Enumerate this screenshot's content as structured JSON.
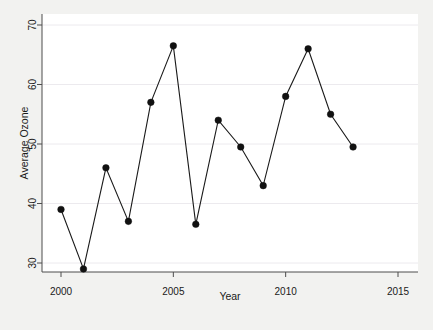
{
  "chart_data": {
    "type": "line",
    "title": "",
    "xlabel": "Year",
    "ylabel": "Average Ozone",
    "x": [
      2000,
      2001,
      2002,
      2003,
      2004,
      2005,
      2006,
      2007,
      2008,
      2009,
      2010,
      2011,
      2012,
      2013
    ],
    "values": [
      39,
      29,
      46,
      37,
      57,
      66.5,
      36.5,
      54,
      49.5,
      43,
      58,
      66,
      55,
      49.5
    ],
    "series": [
      {
        "name": "Average Ozone",
        "values": [
          39,
          29,
          46,
          37,
          57,
          66.5,
          36.5,
          54,
          49.5,
          43,
          58,
          66,
          55,
          49.5
        ]
      }
    ],
    "xlim": [
      2000,
      2015
    ],
    "ylim": [
      28.5,
      70.5
    ],
    "xticks": [
      2000,
      2005,
      2010,
      2015
    ],
    "xtick_labels": [
      "2000",
      "2005",
      "2010",
      "2015"
    ],
    "yticks": [
      30,
      40,
      50,
      60,
      70
    ],
    "ytick_labels": [
      "30",
      "40",
      "50",
      "60",
      "70"
    ],
    "grid": true,
    "grid_axis": "y",
    "legend": false,
    "legend_position": "none",
    "marker": "filled-circle",
    "line_color": "#1a1a1a",
    "marker_color": "#111111",
    "grid_color": "#eceaee",
    "panel_background": "#ffffff",
    "figure_background": "#f2f2f0"
  }
}
